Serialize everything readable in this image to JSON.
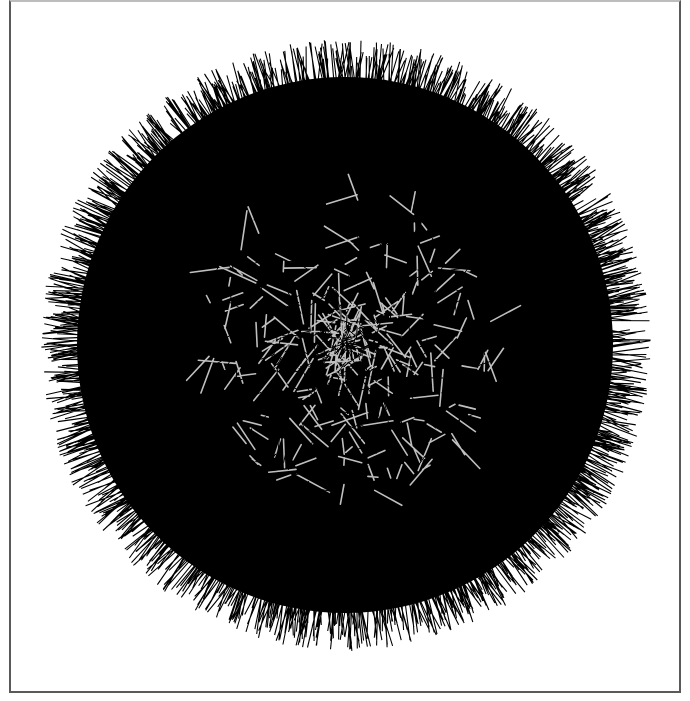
{
  "artwork": {
    "title": "Spiky sphere generative drawing",
    "center": [
      345,
      345
    ],
    "outer_radius": 298,
    "inner_radius": 150,
    "spike_count": 1400,
    "inner_line_count": 260,
    "stroke_color": "#000000",
    "highlight_color": "#ffffff",
    "background": "#ffffff",
    "frame_color": "#5a5a5a"
  }
}
